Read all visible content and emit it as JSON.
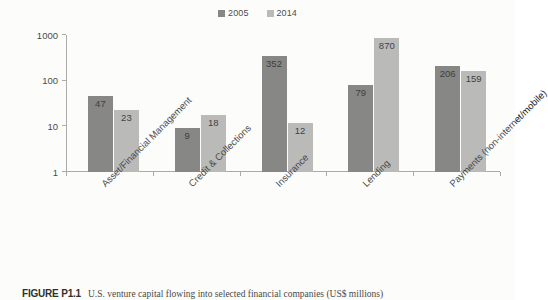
{
  "figure": {
    "caption_label": "FIGURE P1.1",
    "caption_text": "U.S. venture capital flowing into selected financial companies (US$ millions)"
  },
  "legend": {
    "position": "top-center",
    "entries": [
      {
        "label": "2005",
        "color": "#6e6e6e"
      },
      {
        "label": "2014",
        "color": "#adadad"
      }
    ]
  },
  "axis": {
    "y_ticks": [
      "1000",
      "100",
      "10",
      "1"
    ],
    "x_ticks_count": 6
  },
  "chart_data": {
    "type": "bar",
    "title": "",
    "subtitle": "",
    "xlabel": "",
    "ylabel": "",
    "yscale": "log",
    "ylim": [
      1,
      1000
    ],
    "ytick_values": [
      1,
      10,
      100,
      1000
    ],
    "grid": false,
    "legend_position": "top-center",
    "categories": [
      "Asset/Financial Management",
      "Credit & Collections",
      "Insurance",
      "Lending",
      "Payments (non-internet/mobile)"
    ],
    "series": [
      {
        "name": "2005",
        "color": "#6e6e6e",
        "values": [
          47,
          9,
          352,
          79,
          206
        ],
        "labels": [
          "47",
          "9",
          "352",
          "79",
          "206"
        ]
      },
      {
        "name": "2014",
        "color": "#adadad",
        "values": [
          23,
          18,
          12,
          870,
          159
        ],
        "labels": [
          "23",
          "18",
          "12",
          "870",
          "159"
        ]
      }
    ],
    "units": "US$ millions"
  }
}
